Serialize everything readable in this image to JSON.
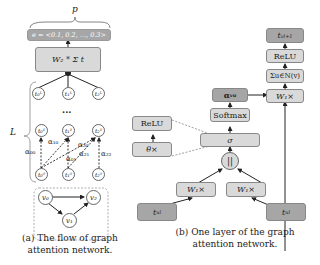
{
  "panel_a": {
    "p_label": "p",
    "e_vector": "e = <0.1, 0.2, ..., 0.3>",
    "sum_box": "W₂ * Σ t",
    "sum_sub": "v∈V",
    "sum_sup": "L",
    "sum_var_sub": "v",
    "L_label": "L",
    "dots": "...",
    "top_nodes": [
      "t₀ᴸ",
      "t₁ᴸ",
      "t₂ᴸ"
    ],
    "mid_nodes": [
      "t₀¹",
      "t₁¹",
      "t₂¹"
    ],
    "bottom_nodes": [
      "t₀⁰",
      "t₁⁰",
      "t₂⁰"
    ],
    "alphas": [
      "α₀₀",
      "α₁₀",
      "α₂₀",
      "α₀₁",
      "α₂₁",
      "α₂₂"
    ],
    "graph_nodes": [
      "v₀",
      "v₂",
      "v₁"
    ],
    "caption_line1": "(a) The flow of graph",
    "caption_line2": "attention network."
  },
  "panel_b": {
    "output": "t_v^{l+1}",
    "output_text": "t",
    "output_sub": "v",
    "output_sup": "l+1",
    "relu_right": "ReLU",
    "sum_right": "Σu∈N(v)",
    "w1_right": "W₁×",
    "alpha": "α",
    "alpha_sub": "vu",
    "softmax": "Softmax",
    "sigma": "σ",
    "relu_left": "ReLU",
    "theta": "θ×",
    "concat": "||",
    "w1_left": "W₁×",
    "w1_mid": "W₁×",
    "input_left": "t",
    "input_left_sub": "u",
    "input_left_sup": "l",
    "input_right": "t",
    "input_right_sub": "u",
    "input_right_sup": "l",
    "caption_line1": "(b) One layer of the graph",
    "caption_line2": "attention network."
  },
  "colors": {
    "light_box": "#d9d9d9",
    "dark_box": "#a6a6a6",
    "border": "#888888"
  }
}
